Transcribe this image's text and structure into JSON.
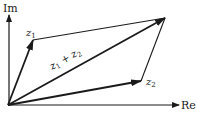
{
  "diagram": {
    "type": "vector-addition-complex-plane",
    "axes": {
      "x_label": "Re",
      "y_label": "Im"
    },
    "vectors": [
      {
        "name": "z1",
        "label_base": "z",
        "label_sub": "1",
        "from": [
          8,
          105
        ],
        "to": [
          33,
          40
        ]
      },
      {
        "name": "z2",
        "label_base": "z",
        "label_sub": "2",
        "from": [
          8,
          105
        ],
        "to": [
          141,
          81
        ]
      },
      {
        "name": "z1+z2",
        "from": [
          8,
          105
        ],
        "to": [
          165,
          18
        ]
      }
    ],
    "sum_label": {
      "a_base": "z",
      "a_sub": "1",
      "op": "+",
      "b_base": "z",
      "b_sub": "2"
    },
    "parallelogram_edges": [
      {
        "from": [
          33,
          40
        ],
        "to": [
          165,
          18
        ]
      },
      {
        "from": [
          141,
          81
        ],
        "to": [
          165,
          18
        ]
      }
    ],
    "colors": {
      "ink": "#1a1a1a",
      "background": "#ffffff"
    }
  }
}
